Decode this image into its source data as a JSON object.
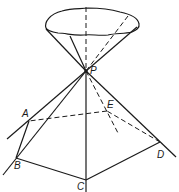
{
  "diagram": {
    "type": "geometric-figure",
    "colors": {
      "stroke": "#1a1a1a",
      "background": "#ffffff"
    },
    "labels": {
      "P": "P",
      "A": "A",
      "B": "B",
      "C": "C",
      "D": "D",
      "E": "E"
    },
    "points": {
      "P": [
        86,
        71
      ],
      "A": [
        29,
        121
      ],
      "B": [
        16,
        158
      ],
      "C": [
        86,
        180
      ],
      "D": [
        160,
        142
      ],
      "E": [
        107,
        111
      ]
    }
  }
}
